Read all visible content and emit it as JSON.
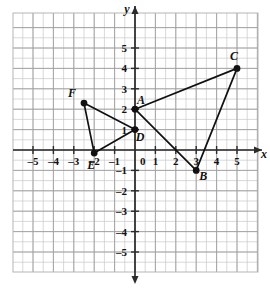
{
  "figure": {
    "title": "",
    "type": "coordinate-plane"
  },
  "chart_data": {
    "type": "scatter",
    "title": "",
    "xlabel": "x",
    "ylabel": "y",
    "xlim": [
      -6,
      6
    ],
    "ylim": [
      -6,
      6
    ],
    "grid": true,
    "legend": "none",
    "x_ticks": [
      -5,
      -4,
      -3,
      -2,
      -1,
      0,
      1,
      2,
      3,
      4,
      5
    ],
    "y_ticks": [
      -5,
      -4,
      -3,
      -2,
      -1,
      1,
      2,
      3,
      4,
      5
    ],
    "x_tick_labels": [
      "-5",
      "-4",
      "-3",
      "-2",
      "-1",
      "0",
      "1",
      "2",
      "3",
      "4",
      "5"
    ],
    "y_tick_labels": [
      "-5",
      "-4",
      "-3",
      "-2",
      "-1",
      "1",
      "2",
      "3",
      "4",
      "5"
    ],
    "origin_label": "0",
    "points": [
      {
        "name": "A",
        "x": 0,
        "y": 2,
        "label": "A",
        "label_dx": 6,
        "label_dy": -5
      },
      {
        "name": "B",
        "x": 3,
        "y": -1,
        "label": "B",
        "label_dx": 7,
        "label_dy": 10
      },
      {
        "name": "C",
        "x": 5,
        "y": 4,
        "label": "C",
        "label_dx": -3,
        "label_dy": -8
      },
      {
        "name": "D",
        "x": 0,
        "y": 1,
        "label": "D",
        "label_dx": 5,
        "label_dy": 11
      },
      {
        "name": "E",
        "x": -2,
        "y": -0.15,
        "label": "E",
        "label_dx": -3,
        "label_dy": 16
      },
      {
        "name": "F",
        "x": -2.5,
        "y": 2.3,
        "label": "F",
        "label_dx": -12,
        "label_dy": -6
      }
    ],
    "triangles": [
      {
        "name": "triangle-ABC",
        "vertices": [
          "A",
          "B",
          "C"
        ]
      },
      {
        "name": "triangle-DEF",
        "vertices": [
          "D",
          "E",
          "F"
        ]
      }
    ],
    "series": [
      {
        "name": "triangle-ABC",
        "x": [
          0,
          3,
          5,
          0
        ],
        "y": [
          2,
          -1,
          4,
          2
        ]
      },
      {
        "name": "triangle-DEF",
        "x": [
          0,
          -2,
          -2.5,
          0
        ],
        "y": [
          1,
          -0.15,
          2.3,
          1
        ]
      }
    ]
  },
  "colors": {
    "grid_minor": "#c9c9c9",
    "grid_major": "#9e9e9e",
    "axis": "#2b2b2b",
    "point": "#111111",
    "segment": "#111111",
    "background": "#ffffff"
  }
}
